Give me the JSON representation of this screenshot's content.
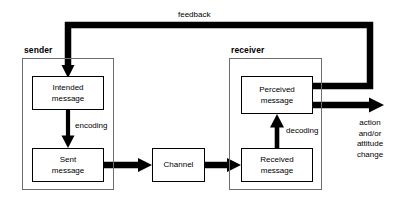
{
  "diagram": {
    "colors": {
      "line": "#000000",
      "group_border": "#6e6e6e",
      "background": "#ffffff",
      "text": "#000000"
    },
    "groups": [
      {
        "id": "sender",
        "label": "sender"
      },
      {
        "id": "receiver",
        "label": "receiver"
      }
    ],
    "nodes": [
      {
        "id": "intended_message",
        "label": "Intended\nmessage"
      },
      {
        "id": "sent_message",
        "label": "Sent\nmessage"
      },
      {
        "id": "channel",
        "label": "Channel"
      },
      {
        "id": "received_message",
        "label": "Received\nmessage"
      },
      {
        "id": "perceived_message",
        "label": "Perceived\nmessage"
      }
    ],
    "edge_labels": [
      {
        "id": "encoding",
        "label": "encoding"
      },
      {
        "id": "decoding",
        "label": "decoding"
      },
      {
        "id": "feedback",
        "label": "feedback"
      }
    ],
    "outcome": {
      "id": "outcome",
      "label": "action\nand/or\nattitude\nchange"
    }
  }
}
